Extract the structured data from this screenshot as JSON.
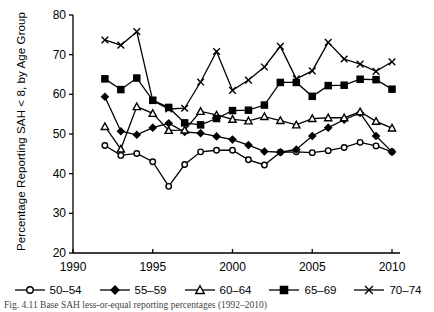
{
  "figure": {
    "caption": "Fig. 4.11   Base SAH less-or-equal reporting percentages (1992–2010)"
  },
  "chart_data": {
    "type": "line",
    "title": "",
    "xlabel": "",
    "ylabel": "Percentage Reporting SAH < 8, by Age Group",
    "xlim": [
      1990,
      2010
    ],
    "ylim": [
      20,
      80
    ],
    "xticks": [
      1990,
      1995,
      2000,
      2005,
      2010
    ],
    "yticks": [
      20,
      30,
      40,
      50,
      60,
      70,
      80
    ],
    "grid": false,
    "legend_position": "bottom",
    "x": [
      1992,
      1993,
      1994,
      1995,
      1996,
      1997,
      1998,
      1999,
      2000,
      2001,
      2002,
      2003,
      2004,
      2005,
      2006,
      2007,
      2008,
      2009,
      2010
    ],
    "series": [
      {
        "name": "50–54",
        "marker": "open-circle",
        "values": [
          47.1,
          44.6,
          45.1,
          43.0,
          36.8,
          42.3,
          45.5,
          45.9,
          45.9,
          43.5,
          42.2,
          45.4,
          45.5,
          45.3,
          45.8,
          46.6,
          47.9,
          47.0,
          45.5
        ]
      },
      {
        "name": "55–59",
        "marker": "filled-diamond",
        "values": [
          59.4,
          50.7,
          49.8,
          51.6,
          52.7,
          50.5,
          50.2,
          49.4,
          48.6,
          47.2,
          45.6,
          45.4,
          46.1,
          49.5,
          51.6,
          53.6,
          55.3,
          49.5,
          45.5
        ]
      },
      {
        "name": "60–64",
        "marker": "open-triangle",
        "values": [
          51.9,
          46.2,
          56.9,
          55.2,
          50.9,
          51.0,
          55.7,
          54.8,
          53.7,
          53.3,
          54.4,
          53.4,
          52.3,
          53.9,
          54.1,
          54.1,
          55.6,
          53.2,
          51.5
        ]
      },
      {
        "name": "65–69",
        "marker": "filled-square",
        "values": [
          63.9,
          61.2,
          64.1,
          58.5,
          56.7,
          52.8,
          52.3,
          53.9,
          55.9,
          56.0,
          57.3,
          63.0,
          63.0,
          59.5,
          62.2,
          62.3,
          63.8,
          63.7,
          61.3
        ]
      },
      {
        "name": "70–74",
        "marker": "cross",
        "values": [
          73.7,
          72.4,
          75.8,
          58.4,
          56.3,
          56.5,
          63.1,
          70.8,
          61.0,
          63.6,
          66.9,
          72.1,
          63.9,
          65.9,
          73.1,
          68.9,
          67.6,
          65.8,
          68.2
        ]
      }
    ]
  },
  "legend": {
    "items": [
      {
        "label": "50–54",
        "marker": "open-circle"
      },
      {
        "label": "55–59",
        "marker": "filled-diamond"
      },
      {
        "label": "60–64",
        "marker": "open-triangle"
      },
      {
        "label": "65–69",
        "marker": "filled-square"
      },
      {
        "label": "70–74",
        "marker": "cross"
      }
    ]
  },
  "colors": {
    "line": "#000000",
    "axis": "#000000",
    "background": "#ffffff"
  }
}
